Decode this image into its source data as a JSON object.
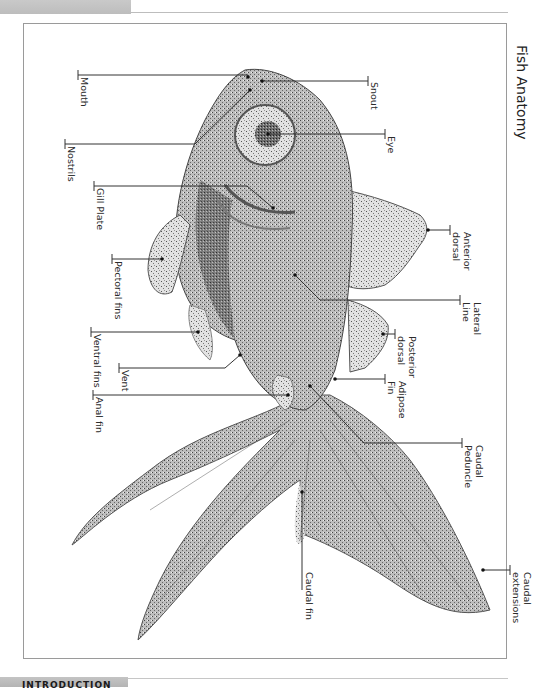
{
  "page": {
    "section_header": "INTRODUCTION"
  },
  "figure": {
    "title": "Fish Anatomy",
    "labels": {
      "mouth": "Mouth",
      "nostrils": "Nostrils",
      "gill_plate": "Gill Plate",
      "pectoral_fins": "Pectoral fins",
      "ventral_fins": "Ventral fins",
      "vent": "Vent",
      "anal_fin": "Anal fin",
      "snout": "Snout",
      "eye": "Eye",
      "anterior_dorsal_1": "Anterior",
      "anterior_dorsal_2": "dorsal",
      "lateral_line_1": "Lateral",
      "lateral_line_2": "Line",
      "posterior_dorsal_1": "Posterior",
      "posterior_dorsal_2": "dorsal",
      "adipose_fin_1": "Adipose",
      "adipose_fin_2": "Fin",
      "caudal_peduncle_1": "Caudal",
      "caudal_peduncle_2": "Peduncle",
      "caudal_fin": "Caudal fin",
      "caudal_extensions_1": "Caudal",
      "caudal_extensions_2": "extensions"
    },
    "colors": {
      "frame": "#9a9a9a",
      "leader_line": "#333333",
      "fish_dark": "#3c3c3c",
      "fish_mid": "#8a8a8a",
      "fish_light": "#cfcfcf"
    }
  }
}
